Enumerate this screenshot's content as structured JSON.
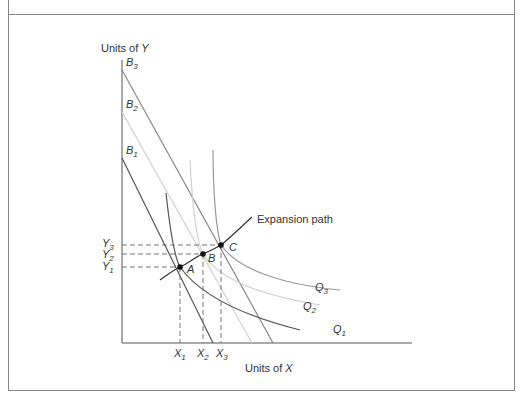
{
  "diagram": {
    "type": "isoquant-expansion-path",
    "axes": {
      "y_label_prefix": "Units of ",
      "y_label_var": "Y",
      "x_label_prefix": "Units of ",
      "x_label_var": "X"
    },
    "budget_lines": [
      {
        "name": "B",
        "sub": "1",
        "color": "#555555"
      },
      {
        "name": "B",
        "sub": "2",
        "color": "#d0d0d0"
      },
      {
        "name": "B",
        "sub": "3",
        "color": "#888888"
      }
    ],
    "isoquants": [
      {
        "name": "Q",
        "sub": "1",
        "color": "#555555"
      },
      {
        "name": "Q",
        "sub": "2",
        "color": "#d0d0d0"
      },
      {
        "name": "Q",
        "sub": "3",
        "color": "#999999"
      }
    ],
    "points": [
      {
        "label": "A",
        "x_tick": "X",
        "x_sub": "1",
        "y_tick": "Y",
        "y_sub": "1"
      },
      {
        "label": "B",
        "x_tick": "X",
        "x_sub": "2",
        "y_tick": "Y",
        "y_sub": "2"
      },
      {
        "label": "C",
        "x_tick": "X",
        "x_sub": "3",
        "y_tick": "Y",
        "y_sub": "3"
      }
    ],
    "expansion_path_label": "Expansion path"
  },
  "colors": {
    "frame": "#888888",
    "axis": "#555555",
    "text": "#333333",
    "dashed": "#666666",
    "point": "#111111"
  }
}
